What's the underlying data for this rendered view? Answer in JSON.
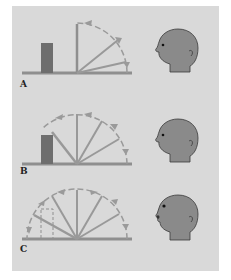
{
  "figure": {
    "colors": {
      "background": "#d9d9d9",
      "line": "#8f8f8f",
      "block": "#707070",
      "head": "#8a8a8a",
      "head_outline": "#3a3a3a",
      "arrow": "#9a9a9a"
    },
    "panels": [
      {
        "label": "A",
        "block": "solid",
        "sweep_degrees": 90,
        "mouth": "closed"
      },
      {
        "label": "B",
        "block": "solid",
        "sweep_degrees": 135,
        "mouth": "closed"
      },
      {
        "label": "C",
        "block": "dashed",
        "sweep_degrees": 180,
        "mouth": "open"
      }
    ]
  }
}
